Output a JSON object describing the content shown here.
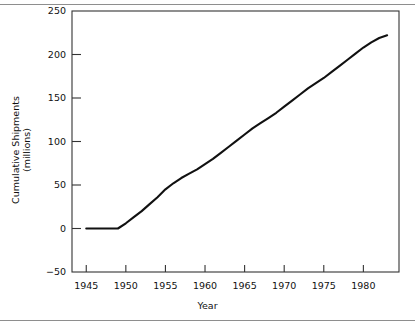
{
  "page": {
    "background_color": "#ffffff",
    "rule_color": "#8e8e8e",
    "top_rule_label": "page-rule-top",
    "bottom_rule_label": "page-rule-bottom"
  },
  "figure": {
    "line_color": "#111111",
    "axis_color": "#333333",
    "frame": {
      "left": 72,
      "right": 399,
      "top": 11,
      "bottom": 272
    }
  },
  "chart_data": {
    "type": "line",
    "title": "",
    "subtitle": "",
    "xlabel": "Year",
    "ylabel": "Cumulative Shipments (millions)",
    "ylabel_line1": "Cumulative Shipments",
    "ylabel_line2": "(millions)",
    "xlim": [
      1943.2,
      1984.5
    ],
    "ylim": [
      -50,
      250
    ],
    "xticks": [
      1945,
      1950,
      1955,
      1960,
      1965,
      1970,
      1975,
      1980
    ],
    "xtick_labels": [
      "1945",
      "1950",
      "1955",
      "1960",
      "1965",
      "1970",
      "1975",
      "1980"
    ],
    "yticks": [
      -50,
      0,
      50,
      100,
      150,
      200,
      250
    ],
    "ytick_labels": [
      "−50",
      "0",
      "50",
      "100",
      "150",
      "200",
      "250"
    ],
    "grid": false,
    "legend": null,
    "annotations": [],
    "series": [
      {
        "name": "Cumulative Shipments",
        "units": "millions",
        "x": [
          1945,
          1946,
          1947,
          1948,
          1949,
          1950,
          1951,
          1952,
          1953,
          1954,
          1955,
          1956,
          1957,
          1958,
          1959,
          1960,
          1961,
          1962,
          1963,
          1964,
          1965,
          1966,
          1967,
          1968,
          1969,
          1970,
          1971,
          1972,
          1973,
          1974,
          1975,
          1976,
          1977,
          1978,
          1979,
          1980,
          1981,
          1982,
          1983
        ],
        "values": [
          0,
          0,
          0,
          0,
          0,
          6,
          13,
          20,
          28,
          36,
          45,
          52,
          58,
          63,
          68,
          74,
          80,
          87,
          94,
          101,
          108,
          115,
          121,
          127,
          133,
          140,
          147,
          154,
          161,
          167,
          173,
          180,
          187,
          194,
          201,
          208,
          214,
          219,
          222
        ]
      }
    ]
  }
}
